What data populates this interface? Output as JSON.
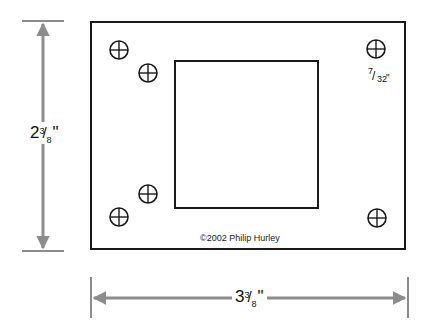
{
  "diagram": {
    "colors": {
      "outline": "#1a1a1a",
      "dimension": "#8c8c8c",
      "text": "#111111"
    },
    "plate": {
      "x": 91,
      "y": 22,
      "width": 314,
      "height": 227
    },
    "cutout": {
      "x": 175,
      "y": 61,
      "width": 143,
      "height": 147
    },
    "holes": [
      {
        "cx": 119,
        "cy": 50,
        "r": 9
      },
      {
        "cx": 148,
        "cy": 73,
        "r": 9
      },
      {
        "cx": 376,
        "cy": 49,
        "r": 9
      },
      {
        "cx": 148,
        "cy": 194,
        "r": 9
      },
      {
        "cx": 119,
        "cy": 217,
        "r": 9
      },
      {
        "cx": 377,
        "cy": 218,
        "r": 9
      }
    ],
    "hole_size_label": {
      "whole": "",
      "num": "7",
      "den": "32",
      "unit": "\""
    },
    "height_dimension": {
      "whole": "2",
      "num": "3",
      "den": "8",
      "unit": "\""
    },
    "width_dimension": {
      "whole": "3",
      "num": "3",
      "den": "8",
      "unit": "\""
    },
    "copyright": "©2002 Philip Hurley"
  }
}
